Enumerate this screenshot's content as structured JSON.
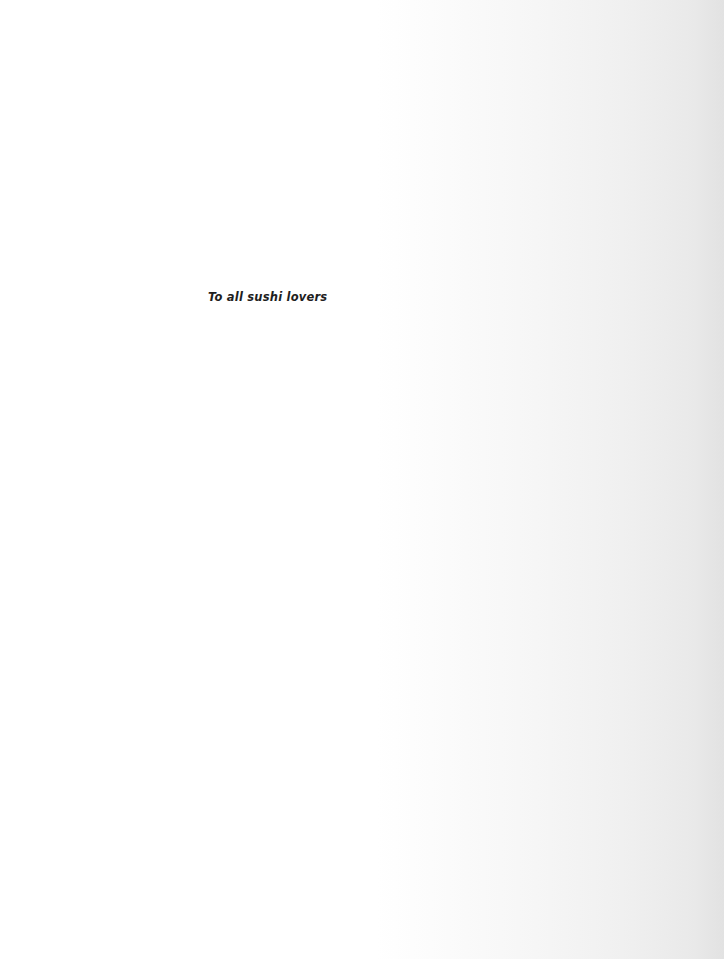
{
  "page": {
    "dedication": "To all sushi lovers"
  },
  "colors": {
    "background": "#ffffff",
    "edge_shadow": "#e2e2e2",
    "text": "#1e1e1e"
  }
}
